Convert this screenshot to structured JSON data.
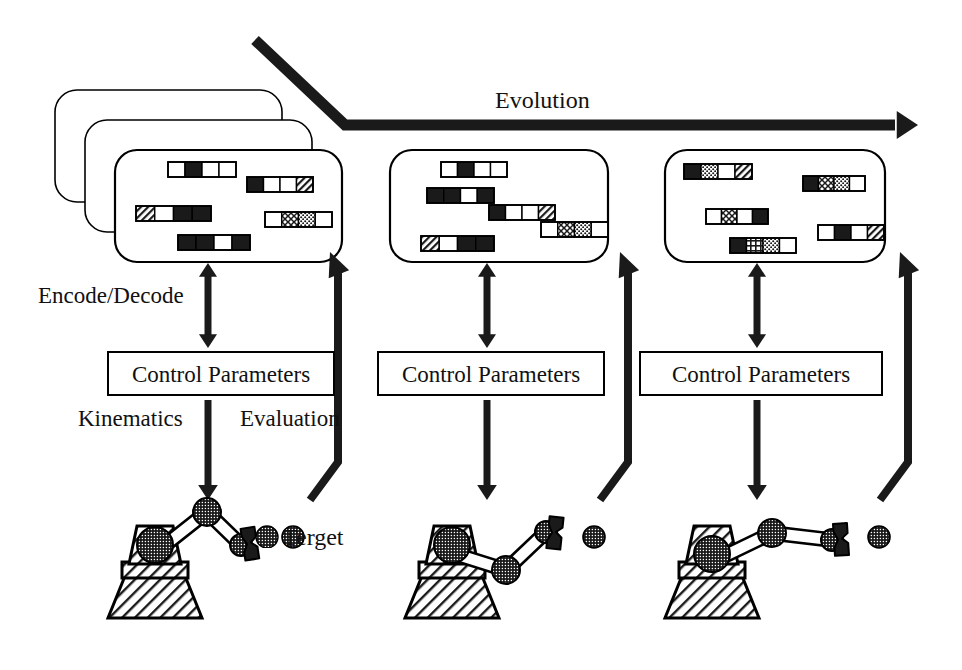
{
  "figure": {
    "title_label": "Evolution"
  },
  "labels": {
    "evolution": "Evolution",
    "encode_decode": "Encode/Decode",
    "kinematics": "Kinematics",
    "evaluation": "Evaluation",
    "target": "Terget"
  },
  "colors": {
    "ink": "#111111",
    "stroke": "#000000",
    "fill_white": "#ffffff",
    "fill_black": "#1a1a1a",
    "background": "#ffffff"
  },
  "control_boxes": [
    {
      "label": "Control Parameters",
      "x": 108,
      "y": 352,
      "w": 226,
      "h": 43
    },
    {
      "label": "Control Parameters",
      "x": 378,
      "y": 352,
      "w": 226,
      "h": 43
    },
    {
      "label": "Control Parameters",
      "x": 640,
      "y": 352,
      "w": 242,
      "h": 43
    }
  ],
  "generations": [
    {
      "name": "generation-1",
      "stacked": true,
      "stack_offsets": [
        {
          "dx": -60,
          "dy": -60
        },
        {
          "dx": -30,
          "dy": -30
        },
        {
          "dx": 0,
          "dy": 0
        }
      ],
      "panel": {
        "x": 115,
        "y": 150,
        "w": 227,
        "h": 112
      },
      "chromosomes": [
        {
          "x": 168,
          "y": 162,
          "w": 68,
          "h": 15,
          "genes": [
            "white",
            "black",
            "white",
            "white"
          ]
        },
        {
          "x": 247,
          "y": 177,
          "w": 66,
          "h": 15,
          "genes": [
            "black",
            "white",
            "white",
            "hatch"
          ]
        },
        {
          "x": 136,
          "y": 206,
          "w": 75,
          "h": 15,
          "genes": [
            "hatch",
            "white",
            "black",
            "black"
          ]
        },
        {
          "x": 265,
          "y": 212,
          "w": 67,
          "h": 15,
          "genes": [
            "white",
            "cross",
            "dots",
            "white"
          ]
        },
        {
          "x": 178,
          "y": 235,
          "w": 72,
          "h": 15,
          "genes": [
            "black",
            "black",
            "white",
            "black"
          ]
        }
      ]
    },
    {
      "name": "generation-2",
      "stacked": false,
      "stack_offsets": [
        {
          "dx": 0,
          "dy": 0
        }
      ],
      "panel": {
        "x": 390,
        "y": 150,
        "w": 218,
        "h": 112
      },
      "chromosomes": [
        {
          "x": 441,
          "y": 162,
          "w": 66,
          "h": 15,
          "genes": [
            "white",
            "black",
            "white",
            "white"
          ]
        },
        {
          "x": 427,
          "y": 188,
          "w": 67,
          "h": 15,
          "genes": [
            "black",
            "black",
            "white",
            "black"
          ]
        },
        {
          "x": 489,
          "y": 205,
          "w": 66,
          "h": 15,
          "genes": [
            "black",
            "white",
            "white",
            "hatch"
          ]
        },
        {
          "x": 541,
          "y": 222,
          "w": 67,
          "h": 15,
          "genes": [
            "white",
            "cross",
            "dots",
            "white"
          ]
        },
        {
          "x": 421,
          "y": 236,
          "w": 73,
          "h": 15,
          "genes": [
            "hatch",
            "white",
            "black",
            "black"
          ]
        }
      ]
    },
    {
      "name": "generation-3",
      "stacked": false,
      "stack_offsets": [
        {
          "dx": 0,
          "dy": 0
        }
      ],
      "panel": {
        "x": 665,
        "y": 150,
        "w": 220,
        "h": 112
      },
      "chromosomes": [
        {
          "x": 684,
          "y": 164,
          "w": 68,
          "h": 15,
          "genes": [
            "black",
            "dots",
            "white",
            "hatch"
          ]
        },
        {
          "x": 803,
          "y": 176,
          "w": 62,
          "h": 15,
          "genes": [
            "black",
            "cross",
            "dots",
            "white"
          ]
        },
        {
          "x": 706,
          "y": 209,
          "w": 62,
          "h": 15,
          "genes": [
            "white",
            "cross",
            "white",
            "black"
          ]
        },
        {
          "x": 818,
          "y": 225,
          "w": 66,
          "h": 15,
          "genes": [
            "white",
            "black",
            "white",
            "hatch"
          ]
        },
        {
          "x": 730,
          "y": 238,
          "w": 66,
          "h": 15,
          "genes": [
            "black",
            "grid",
            "dots",
            "white"
          ]
        }
      ]
    }
  ],
  "robots": [
    {
      "name": "robot-arm-1",
      "base_x": 155,
      "base_y": 560,
      "shoulder": {
        "x": 155,
        "y": 553
      },
      "elbow": {
        "x": 207,
        "y": 512
      },
      "wrist": {
        "x": 241,
        "y": 545
      },
      "target": {
        "x": 293,
        "y": 537,
        "r": 11
      }
    },
    {
      "name": "robot-arm-2",
      "base_x": 452,
      "base_y": 560,
      "shoulder": {
        "x": 452,
        "y": 553
      },
      "elbow": {
        "x": 506,
        "y": 570
      },
      "wrist": {
        "x": 546,
        "y": 532
      },
      "target": {
        "x": 594,
        "y": 537,
        "r": 11
      }
    },
    {
      "name": "robot-arm-3",
      "base_x": 712,
      "base_y": 560,
      "shoulder": {
        "x": 712,
        "y": 562
      },
      "elbow": {
        "x": 772,
        "y": 533
      },
      "wrist": {
        "x": 832,
        "y": 540
      },
      "target": {
        "x": 879,
        "y": 537,
        "r": 11
      }
    }
  ],
  "arrows": {
    "evolution": {
      "label": "Evolution",
      "points": "255,40 345,125 895,125",
      "head_at": {
        "x": 900,
        "y": 125
      }
    },
    "encode_decode_double": [
      {
        "x": 208,
        "y_top": 263,
        "y_bottom": 348
      },
      {
        "x": 487,
        "y_top": 263,
        "y_bottom": 348
      },
      {
        "x": 757,
        "y_top": 263,
        "y_bottom": 348
      }
    ],
    "kinematics_down": [
      {
        "x": 208,
        "y_top": 400,
        "y_bottom": 500
      },
      {
        "x": 487,
        "y_top": 400,
        "y_bottom": 500
      },
      {
        "x": 757,
        "y_top": 400,
        "y_bottom": 500
      }
    ],
    "evaluation_feedback": [
      {
        "points": "310,500 338,462 338,272 330,252"
      },
      {
        "points": "600,500 628,462 628,272 620,252"
      },
      {
        "points": "880,500 908,462 908,272 900,252"
      }
    ]
  }
}
